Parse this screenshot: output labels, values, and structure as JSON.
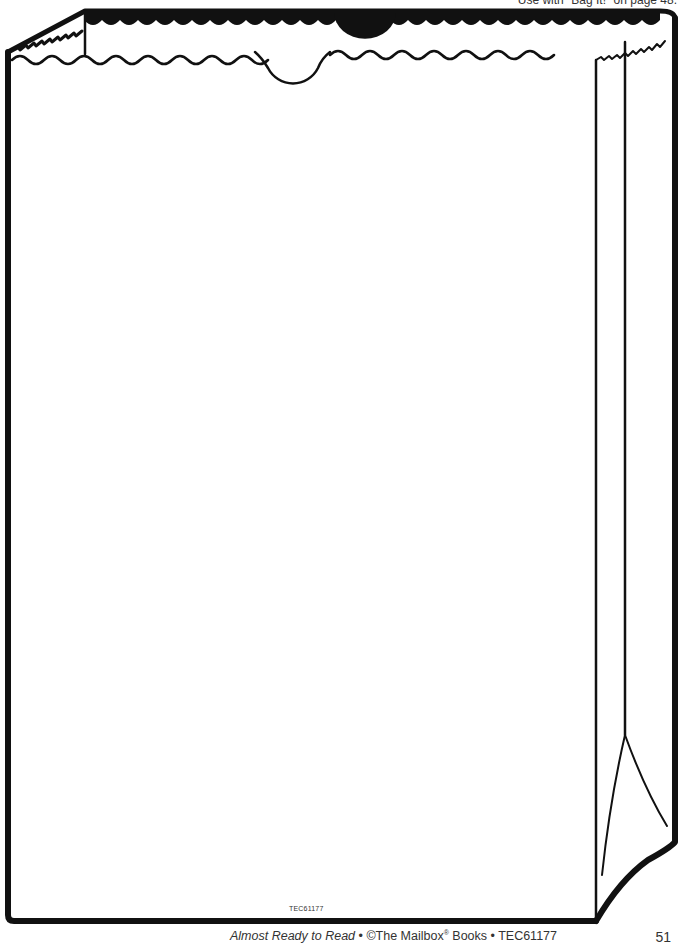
{
  "header": {
    "note": "Use with \"Bag It!\" on page 48."
  },
  "illustration": {
    "subject": "paper-lunch-bag-outline",
    "stroke_color": "#111111",
    "fill_color": "#ffffff"
  },
  "bag_code": "TEC61177",
  "footer": {
    "book_title": "Almost Ready to Read",
    "separator": " • ",
    "copyright": "©The Mailbox",
    "registered": "®",
    "books": " Books • TEC61177",
    "page_number": "51"
  }
}
